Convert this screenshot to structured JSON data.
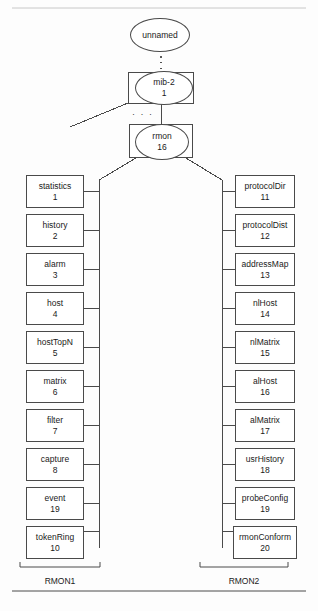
{
  "diagram": {
    "title_root": "unnamed",
    "root": {
      "label": "unnamed"
    },
    "mib2": {
      "label": "mib-2",
      "number": "1"
    },
    "rmon": {
      "label": "rmon",
      "number": "16"
    },
    "ellipsis_vertical": "vertical-ellipsis",
    "ellipsis_horizontal": "· · ·",
    "left_group": {
      "caption": "RMON1",
      "nodes": [
        {
          "label": "statistics",
          "number": "1"
        },
        {
          "label": "history",
          "number": "2"
        },
        {
          "label": "alarm",
          "number": "3"
        },
        {
          "label": "host",
          "number": "4"
        },
        {
          "label": "hostTopN",
          "number": "5"
        },
        {
          "label": "matrix",
          "number": "6"
        },
        {
          "label": "filter",
          "number": "7"
        },
        {
          "label": "capture",
          "number": "8"
        },
        {
          "label": "event",
          "number": "19"
        },
        {
          "label": "tokenRing",
          "number": "10"
        }
      ]
    },
    "right_group": {
      "caption": "RMON2",
      "nodes": [
        {
          "label": "protocolDir",
          "number": "11"
        },
        {
          "label": "protocolDist",
          "number": "12"
        },
        {
          "label": "addressMap",
          "number": "13"
        },
        {
          "label": "nlHost",
          "number": "14"
        },
        {
          "label": "nlMatrix",
          "number": "15"
        },
        {
          "label": "alHost",
          "number": "16"
        },
        {
          "label": "alMatrix",
          "number": "17"
        },
        {
          "label": "usrHistory",
          "number": "18"
        },
        {
          "label": "probeConfig",
          "number": "19"
        },
        {
          "label": "rmonConform",
          "number": "20"
        }
      ]
    },
    "colors": {
      "stroke": "#4a4a4a",
      "text": "#1a1a1a",
      "background": "#fdfdfd"
    }
  }
}
